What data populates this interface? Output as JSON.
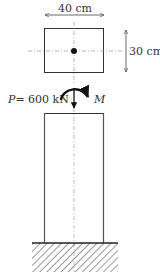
{
  "diagram": {
    "cross_section": {
      "width_label": "40 cm",
      "height_label": "30 cm"
    },
    "load": {
      "axial_symbol": "P",
      "axial_eq": "= 600 kN",
      "moment_symbol": "M"
    },
    "colors": {
      "line": "#333333",
      "centerline": "#888888",
      "hatch": "#444444"
    }
  }
}
